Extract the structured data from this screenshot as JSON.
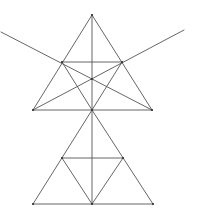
{
  "figure": {
    "width": 199,
    "height": 213,
    "background": "#ffffff",
    "stroke_color": "#555555",
    "point_color": "#333333",
    "points": {
      "A": [
        92,
        15
      ],
      "B": [
        33,
        110
      ],
      "C": [
        152,
        110
      ],
      "D": [
        62,
        62
      ],
      "E": [
        122,
        62
      ],
      "F": [
        92,
        110
      ],
      "O": [
        92,
        79
      ],
      "G": [
        33,
        204
      ],
      "H": [
        153,
        204
      ],
      "I": [
        62,
        158
      ],
      "J": [
        123,
        158
      ],
      "K": [
        92,
        204
      ],
      "L1": [
        1,
        32
      ],
      "R1": [
        184,
        30
      ]
    },
    "segments": [
      [
        "A",
        "B"
      ],
      [
        "A",
        "C"
      ],
      [
        "B",
        "C"
      ],
      [
        "D",
        "E"
      ],
      [
        "A",
        "F"
      ],
      [
        "L1",
        "C"
      ],
      [
        "B",
        "R1"
      ],
      [
        "D",
        "F"
      ],
      [
        "E",
        "F"
      ],
      [
        "F",
        "G"
      ],
      [
        "F",
        "H"
      ],
      [
        "G",
        "H"
      ],
      [
        "I",
        "J"
      ],
      [
        "F",
        "K"
      ],
      [
        "I",
        "K"
      ],
      [
        "J",
        "K"
      ]
    ],
    "marked_points": [
      "A",
      "B",
      "C",
      "D",
      "E",
      "F",
      "O",
      "G",
      "H",
      "I",
      "J",
      "K"
    ]
  }
}
